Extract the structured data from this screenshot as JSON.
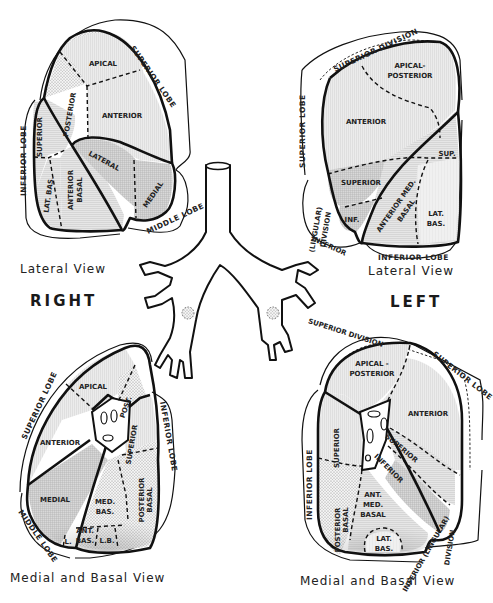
{
  "diagram": {
    "side_labels": {
      "right": "RIGHT",
      "left": "LEFT"
    },
    "colors": {
      "ink": "#111111",
      "shade_light": "#e4e4e4",
      "shade_mid": "#d2d2d2",
      "shade_dark": "#bdbdbd",
      "background": "#ffffff"
    },
    "panels": {
      "right_lateral": {
        "caption": "Lateral View",
        "lobes": {
          "superior": "SUPERIOR LOBE",
          "inferior": "INFERIOR LOBE",
          "middle": "MIDDLE LOBE"
        },
        "segments": {
          "apical": "APICAL",
          "posterior": "POSTERIOR",
          "anterior": "ANTERIOR",
          "superior": "SUPERIOR",
          "lateral": "LATERAL",
          "medial": "MEDIAL",
          "lat_bas": "LAT. BAS.",
          "anterior_basal_1": "ANTERIOR",
          "anterior_basal_2": "BASAL"
        }
      },
      "left_lateral": {
        "caption": "Lateral View",
        "lobes": {
          "superior": "SUPERIOR LOBE",
          "superior_division": "SUPERIOR DIVISION",
          "inferior_lingular_1": "(LINGULAR)",
          "inferior_lingular_2": "DIVISION",
          "inferior_lingular_3": "INFERIOR",
          "inferior": "INFERIOR LOBE"
        },
        "segments": {
          "apical_posterior_1": "APICAL-",
          "apical_posterior_2": "POSTERIOR",
          "anterior": "ANTERIOR",
          "sup": "SUP.",
          "superior": "SUPERIOR",
          "inf": "INF.",
          "ant_med_basal_1": "ANTERIOR MED.",
          "ant_med_basal_2": "BASAL",
          "lat_bas_1": "LAT.",
          "lat_bas_2": "BAS."
        }
      },
      "right_medial": {
        "caption": "Medial and Basal View",
        "lobes": {
          "superior": "SUPERIOR LOBE",
          "inferior": "INFERIOR LOBE",
          "middle": "MIDDLE LOBE"
        },
        "segments": {
          "apical": "APICAL",
          "post": "POST.",
          "anterior": "ANTERIOR",
          "superior": "SUPERIOR",
          "medial": "MEDIAL",
          "med_bas_1": "MED.",
          "med_bas_2": "BAS.",
          "posterior_basal_1": "POSTERIOR",
          "posterior_basal_2": "BASAL",
          "ant_bas_1": "ANT.",
          "ant_bas_2": "BAS.",
          "lb": "L.B.",
          "l": "L."
        }
      },
      "left_medial": {
        "caption": "Medial and Basal View",
        "lobes": {
          "superior_division": "SUPERIOR DIVISION",
          "superior": "SUPERIOR LOBE",
          "inferior": "INFERIOR LOBE",
          "inferior_lingular_1": "INFERIOR (LINGULAR)",
          "inferior_lingular_2": "DIVISION"
        },
        "segments": {
          "apical_posterior_1": "APICAL -",
          "apical_posterior_2": "POSTERIOR",
          "anterior": "ANTERIOR",
          "superior": "SUPERIOR",
          "lingula_superior": "SUPERIOR",
          "lingula_inferior": "INFERIOR",
          "posterior_basal_1": "POSTERIOR",
          "posterior_basal_2": "BASAL",
          "ant_med_basal_1": "ANT.",
          "ant_med_basal_2": "MED.",
          "ant_med_basal_3": "BASAL",
          "lat_bas_1": "LAT.",
          "lat_bas_2": "BAS."
        }
      }
    }
  }
}
